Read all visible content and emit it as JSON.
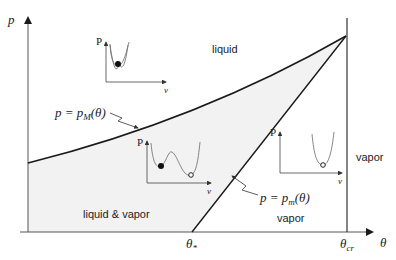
{
  "axes": {
    "y_label": "p",
    "x_label": "θ",
    "x_ticks": [
      {
        "main": "θ",
        "sub": "*"
      },
      {
        "main": "θ",
        "sub": "cr"
      }
    ]
  },
  "regions": {
    "liquid": "liquid",
    "liquid_vapor": "liquid & vapor",
    "vapor_lower": "vapor",
    "vapor_right": "vapor"
  },
  "curves": {
    "upper": {
      "lhs": "p = p",
      "sub": "M",
      "rhs": "(θ)"
    },
    "lower": {
      "lhs": "p = p",
      "sub": "m",
      "rhs": "(θ)"
    }
  },
  "insets": [
    {
      "y_label": "P",
      "x_label": "v",
      "shape": "single-well-filled-dot"
    },
    {
      "y_label": "P",
      "x_label": "v",
      "shape": "double-well-filled-and-open-dot"
    },
    {
      "y_label": "P",
      "x_label": "v",
      "shape": "single-well-open-dot"
    }
  ],
  "colors": {
    "line": "#1a1a1a",
    "shade": "#f2f2f2",
    "inset_curve": "#777777"
  }
}
